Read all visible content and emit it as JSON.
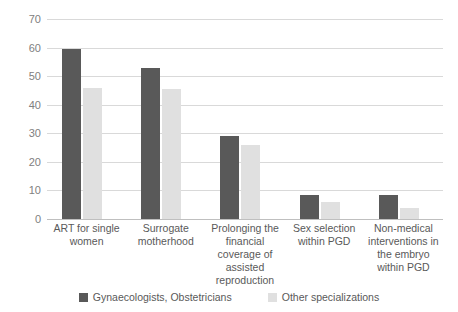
{
  "chart_data": {
    "type": "bar",
    "title": "",
    "subtitle": "",
    "xlabel": "",
    "ylabel": "",
    "ylim": [
      0,
      70
    ],
    "ytick_step": 10,
    "yticks": [
      0,
      10,
      20,
      30,
      40,
      50,
      60,
      70
    ],
    "ytick_labels": [
      "0",
      "10",
      "20",
      "30",
      "40",
      "50",
      "60",
      "70"
    ],
    "grid": true,
    "grid_axis": "y",
    "legend_position": "bottom",
    "categories": [
      "ART for single women",
      "Surrogate motherhood",
      "Prolonging the financial coverage of assisted reproduction",
      "Sex selection within PGD",
      "Non-medical interventions in the embryo within PGD"
    ],
    "series": [
      {
        "name": "Gynaecologists, Obstetricians",
        "color": "#595959",
        "values": [
          59.5,
          53,
          29,
          8.5,
          8.5
        ]
      },
      {
        "name": "Other specializations",
        "color": "#e0e0e0",
        "values": [
          45.8,
          45.5,
          26,
          6,
          4
        ]
      }
    ]
  },
  "colors": {
    "series_dark": "#595959",
    "series_light": "#e0e0e0",
    "gridline": "#d9d9d9",
    "axis": "#bfbfbf",
    "text": "#595959",
    "tick_text": "#808080",
    "background": "#ffffff"
  }
}
